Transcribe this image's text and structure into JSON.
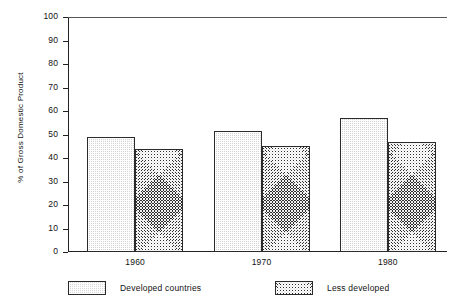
{
  "chart_data": {
    "type": "bar",
    "title": "",
    "subtitle": "",
    "xlabel": "",
    "ylabel": "% of Gross Domestic Product",
    "categories": [
      "1960",
      "1970",
      "1980"
    ],
    "series": [
      {
        "name": "Developed countries",
        "values": [
          49,
          51.5,
          57
        ],
        "pattern": "light-stipple",
        "color": "#d4d4d4"
      },
      {
        "name": "Less developed",
        "values": [
          44,
          45,
          47
        ],
        "pattern": "dark-crosshatch",
        "color": "#2e2e2e"
      }
    ],
    "ylim": [
      0,
      100
    ],
    "ytick_step": 10,
    "yticks": [
      "100",
      "90",
      "80",
      "70",
      "60",
      "50",
      "40",
      "30",
      "20",
      "10",
      "0"
    ],
    "grid": false,
    "legend_position": "bottom",
    "bars_adjacent": true,
    "axis_color": "#222222"
  },
  "axis": {
    "y_title": "% of Gross Domestic Product"
  },
  "legend": {
    "items": [
      {
        "label": "Developed countries"
      },
      {
        "label": "Less developed"
      }
    ]
  }
}
